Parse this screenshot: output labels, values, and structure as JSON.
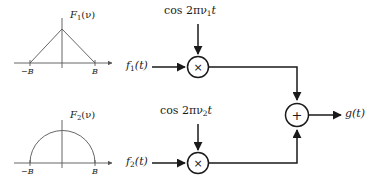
{
  "figure": {
    "type": "frequency-division-multiplexing-block-diagram",
    "stroke_color": "#1a1a1a",
    "background": "#ffffff"
  },
  "spectra": [
    {
      "id": "F1",
      "label_F": "F",
      "label_sub": "1",
      "label_tail": "(ν)",
      "shape": "triangle",
      "tick_left": "−B",
      "tick_right": "B"
    },
    {
      "id": "F2",
      "label_F": "F",
      "label_sub": "2",
      "label_tail": "(ν)",
      "shape": "semicircle",
      "tick_left": "−B",
      "tick_right": "B"
    }
  ],
  "branches": [
    {
      "id": "branch-1",
      "input_f": "f",
      "input_sub": "1",
      "input_tail": "(t)",
      "carrier_head": "cos 2πν",
      "carrier_sub": "1",
      "carrier_tail": "t",
      "operator": "×",
      "operator_name": "multiplier"
    },
    {
      "id": "branch-2",
      "input_f": "f",
      "input_sub": "2",
      "input_tail": "(t)",
      "carrier_head": "cos 2πν",
      "carrier_sub": "2",
      "carrier_tail": "t",
      "operator": "×",
      "operator_name": "multiplier"
    }
  ],
  "summer": {
    "operator": "+",
    "operator_name": "adder"
  },
  "output": {
    "label_g": "g",
    "label_tail": "(t)"
  }
}
